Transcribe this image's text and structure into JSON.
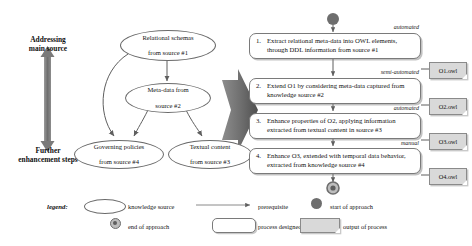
{
  "diagram": {
    "axis": {
      "top_label": "Addressing\nmain source",
      "top_line1": "Addressing",
      "top_line2": "main source",
      "bottom_line1": "Further",
      "bottom_line2": "enhancement steps"
    },
    "knowledge_sources": [
      {
        "id": "ks1",
        "line1": "Relational schemas",
        "line2": "from source #1"
      },
      {
        "id": "ks2",
        "line1": "Meta-data from",
        "line2": "source #2"
      },
      {
        "id": "ks3",
        "line1": "Governing policies",
        "line2": "from source #4"
      },
      {
        "id": "ks4",
        "line1": "Textual content",
        "line2": "from source #3"
      }
    ],
    "steps": [
      {
        "number": "1.",
        "line1": "Extract relational meta-data into OWL elements,",
        "line2": "through DDL information from source #1",
        "annotation": "automated",
        "output": "O1.owl"
      },
      {
        "number": "2.",
        "line1": "Extend O1 by considering meta-data captured from",
        "line2": "knowledge source #2",
        "annotation": "semi-automated",
        "output": "O2.owl"
      },
      {
        "number": "3.",
        "line1": "Enhance properties of O2, applying information",
        "line2": "extracted from textual content in source #3",
        "annotation": "automated",
        "output": "O3.owl"
      },
      {
        "number": "4.",
        "line1": "Enhance O3, extended with temporal data behavior,",
        "line2": "extracted from knowledge source #4",
        "annotation": "manual",
        "output": "O4.owl"
      }
    ],
    "legend": {
      "title": "legend:",
      "knowledge_source": "knowledge source",
      "prerequisite": "prerequisite",
      "start_of_approach": "start of approach",
      "end_of_approach": "end of approach",
      "process_for_step": "process designed for step",
      "output_of_process": "output of process"
    },
    "colors": {
      "arrow_gray": "#6e6e6e",
      "big_arrow": "#6b6b6b",
      "output_fill": "#d9d9d9",
      "stroke": "#7a7a7a",
      "text": "#111111"
    }
  }
}
